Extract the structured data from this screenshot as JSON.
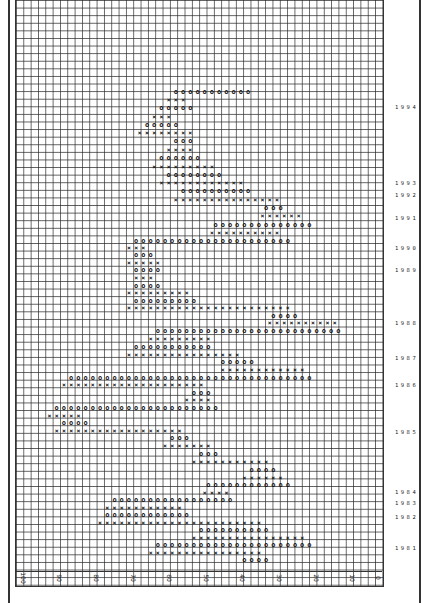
{
  "chart_data": {
    "type": "point-and-figure",
    "orientation": "rotated 90° clockwise (price axis along bottom, time increasing upward)",
    "title": "",
    "xlabel": "Price",
    "ylabel": "Year",
    "price_axis": {
      "ticks": [
        "100",
        "90",
        "80",
        "70",
        "60",
        "50",
        "40",
        "30",
        "20",
        "10",
        "0"
      ],
      "range": [
        100,
        0
      ],
      "box_size": 2
    },
    "year_labels": [
      {
        "year": "1994",
        "y": 108
      },
      {
        "year": "1993",
        "y": 184
      },
      {
        "year": "1992",
        "y": 196
      },
      {
        "year": "1991",
        "y": 219
      },
      {
        "year": "1990",
        "y": 249
      },
      {
        "year": "1989",
        "y": 271
      },
      {
        "year": "1988",
        "y": 324
      },
      {
        "year": "1987",
        "y": 359
      },
      {
        "year": "1986",
        "y": 386
      },
      {
        "year": "1985",
        "y": 433
      },
      {
        "year": "1984",
        "y": 493
      },
      {
        "year": "1983",
        "y": 504
      },
      {
        "year": "1982",
        "y": 518
      },
      {
        "year": "1981",
        "y": 549
      }
    ],
    "columns": [
      {
        "y": 560,
        "type": "O",
        "from": 37,
        "to": 31
      },
      {
        "y": 553,
        "type": "X",
        "from": 63,
        "to": 33
      },
      {
        "y": 545,
        "type": "O",
        "from": 61,
        "to": 18
      },
      {
        "y": 538,
        "type": "X",
        "from": 51,
        "to": 20
      },
      {
        "y": 530,
        "type": "O",
        "from": 49,
        "to": 30
      },
      {
        "y": 523,
        "type": "X",
        "from": 77,
        "to": 32
      },
      {
        "y": 515,
        "type": "O",
        "from": 75,
        "to": 52
      },
      {
        "y": 508,
        "type": "X",
        "from": 75,
        "to": 54
      },
      {
        "y": 500,
        "type": "O",
        "from": 73,
        "to": 40
      },
      {
        "y": 493,
        "type": "X",
        "from": 48,
        "to": 42
      },
      {
        "y": 485,
        "type": "O",
        "from": 47,
        "to": 24
      },
      {
        "y": 478,
        "type": "X",
        "from": 37,
        "to": 26
      },
      {
        "y": 470,
        "type": "O",
        "from": 35,
        "to": 28
      },
      {
        "y": 462,
        "type": "X",
        "from": 51,
        "to": 30
      },
      {
        "y": 454,
        "type": "O",
        "from": 49,
        "to": 44
      },
      {
        "y": 446,
        "type": "X",
        "from": 59,
        "to": 46
      },
      {
        "y": 438,
        "type": "O",
        "from": 57,
        "to": 52
      },
      {
        "y": 431,
        "type": "X",
        "from": 89,
        "to": 54
      },
      {
        "y": 423,
        "type": "O",
        "from": 87,
        "to": 80
      },
      {
        "y": 416,
        "type": "X",
        "from": 91,
        "to": 82
      },
      {
        "y": 408,
        "type": "O",
        "from": 89,
        "to": 44
      },
      {
        "y": 400,
        "type": "X",
        "from": 53,
        "to": 46
      },
      {
        "y": 393,
        "type": "O",
        "from": 51,
        "to": 46
      },
      {
        "y": 385,
        "type": "X",
        "from": 87,
        "to": 48
      },
      {
        "y": 378,
        "type": "O",
        "from": 85,
        "to": 18
      },
      {
        "y": 370,
        "type": "X",
        "from": 43,
        "to": 20
      },
      {
        "y": 362,
        "type": "O",
        "from": 43,
        "to": 35
      },
      {
        "y": 355,
        "type": "X",
        "from": 69,
        "to": 38
      },
      {
        "y": 347,
        "type": "O",
        "from": 67,
        "to": 46
      },
      {
        "y": 339,
        "type": "X",
        "from": 63,
        "to": 47
      },
      {
        "y": 331,
        "type": "O",
        "from": 61,
        "to": 10
      },
      {
        "y": 323,
        "type": "X",
        "from": 30,
        "to": 12
      },
      {
        "y": 316,
        "type": "O",
        "from": 29,
        "to": 22
      },
      {
        "y": 308,
        "type": "X",
        "from": 69,
        "to": 24
      },
      {
        "y": 301,
        "type": "O",
        "from": 67,
        "to": 51
      },
      {
        "y": 293,
        "type": "X",
        "from": 69,
        "to": 53
      },
      {
        "y": 286,
        "type": "O",
        "from": 67,
        "to": 60
      },
      {
        "y": 278,
        "type": "X",
        "from": 67,
        "to": 62
      },
      {
        "y": 270,
        "type": "O",
        "from": 67,
        "to": 60
      },
      {
        "y": 263,
        "type": "X",
        "from": 69,
        "to": 61
      },
      {
        "y": 255,
        "type": "O",
        "from": 67,
        "to": 62
      },
      {
        "y": 248,
        "type": "X",
        "from": 69,
        "to": 64
      },
      {
        "y": 241,
        "type": "O",
        "from": 67,
        "to": 25
      },
      {
        "y": 233,
        "type": "X",
        "from": 46,
        "to": 27
      },
      {
        "y": 225,
        "type": "O",
        "from": 45,
        "to": 18
      },
      {
        "y": 216,
        "type": "X",
        "from": 32,
        "to": 22
      },
      {
        "y": 208,
        "type": "O",
        "from": 31,
        "to": 26
      },
      {
        "y": 200,
        "type": "X",
        "from": 56,
        "to": 27
      },
      {
        "y": 191,
        "type": "O",
        "from": 54,
        "to": 35
      },
      {
        "y": 183,
        "type": "X",
        "from": 60,
        "to": 38
      },
      {
        "y": 175,
        "type": "O",
        "from": 58,
        "to": 43
      },
      {
        "y": 167,
        "type": "X",
        "from": 62,
        "to": 45
      },
      {
        "y": 158,
        "type": "O",
        "from": 60,
        "to": 49
      },
      {
        "y": 150,
        "type": "X",
        "from": 58,
        "to": 51
      },
      {
        "y": 141,
        "type": "O",
        "from": 56,
        "to": 51
      },
      {
        "y": 133,
        "type": "X",
        "from": 66,
        "to": 52
      },
      {
        "y": 125,
        "type": "O",
        "from": 64,
        "to": 56
      },
      {
        "y": 117,
        "type": "X",
        "from": 62,
        "to": 58
      },
      {
        "y": 108,
        "type": "O",
        "from": 60,
        "to": 51
      },
      {
        "y": 100,
        "type": "X",
        "from": 58,
        "to": 53
      },
      {
        "y": 92,
        "type": "O",
        "from": 56,
        "to": 36
      }
    ],
    "grid": true,
    "legend": "none"
  },
  "axis": {
    "labels": [
      "100",
      "90",
      "80",
      "70",
      "60",
      "50",
      "40",
      "30",
      "20",
      "10",
      "0"
    ]
  },
  "colors": {
    "grid": "#3a3a3a",
    "symbols": "#111111",
    "background": "#ffffff"
  }
}
